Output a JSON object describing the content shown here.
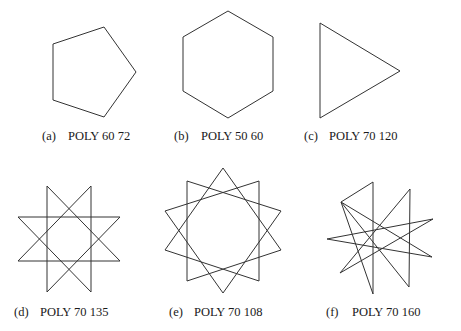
{
  "figure": {
    "stroke_color": "#333333",
    "panels": [
      {
        "id": "a",
        "tag": "(a)",
        "label": "POLY 60 72",
        "command": "POLY",
        "side": 60,
        "angle": 72,
        "shape": "pentagon",
        "points": "104,27 136,72 104,117 53,100 53,44",
        "caption": {
          "x": 42,
          "y": 130,
          "label_x": 68
        }
      },
      {
        "id": "b",
        "tag": "(b)",
        "label": "POLY 50 60",
        "command": "POLY",
        "side": 50,
        "angle": 60,
        "shape": "hexagon",
        "points": "228,11 273,37 273,91 228,118 183,91 183,37",
        "caption": {
          "x": 174,
          "y": 130,
          "label_x": 201
        }
      },
      {
        "id": "c",
        "tag": "(c)",
        "label": "POLY 70 120",
        "command": "POLY",
        "side": 70,
        "angle": 120,
        "shape": "triangle",
        "points": "320,23 400,71 320,118",
        "caption": {
          "x": 304,
          "y": 130,
          "label_x": 329
        }
      },
      {
        "id": "d",
        "tag": "(d)",
        "label": "POLY 70 135",
        "command": "POLY",
        "side": 70,
        "angle": 135,
        "shape": "8-point star",
        "points": "47,186 47,292 120,217 18,217 91,292 91,186 18,261 120,261",
        "caption": {
          "x": 14,
          "y": 306,
          "label_x": 40
        }
      },
      {
        "id": "e",
        "tag": "(e)",
        "label": "POLY 70 108",
        "command": "POLY",
        "side": 70,
        "angle": 108,
        "shape": "10-point star",
        "points": "223,168 281,250 187,281 187,181 281,211 223,293 165,211 259,181 259,281 165,250",
        "caption": {
          "x": 169,
          "y": 306,
          "label_x": 194
        }
      },
      {
        "id": "f",
        "tag": "(f)",
        "label": "POLY 70 160",
        "command": "POLY",
        "side": 70,
        "angle": 160,
        "shape": "9-point star",
        "points": "373,182 373,294 341,202 432,257 327,239 433,219 340,273 410,189 409,287 341,202",
        "caption": {
          "x": 326,
          "y": 306,
          "label_x": 352
        }
      }
    ]
  }
}
